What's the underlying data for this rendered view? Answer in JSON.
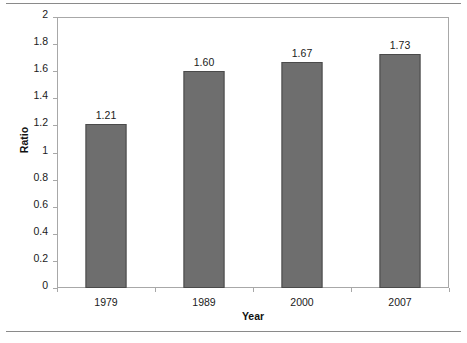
{
  "chart_data": {
    "type": "bar",
    "title": "",
    "categories": [
      "1979",
      "1989",
      "2000",
      "2007"
    ],
    "values": [
      1.21,
      1.6,
      1.67,
      1.73
    ],
    "value_labels": [
      "1.21",
      "1.60",
      "1.67",
      "1.73"
    ],
    "xlabel": "Year",
    "ylabel": "Ratio",
    "ylim": [
      0,
      2
    ],
    "ytick_step": 0.2,
    "ytick_labels": [
      "2",
      "1.8",
      "1.6",
      "1.4",
      "1.2",
      "1",
      "0.8",
      "0.6",
      "0.4",
      "0.2",
      "0"
    ],
    "ytick_values": [
      2,
      1.8,
      1.6,
      1.4,
      1.2,
      1,
      0.8,
      0.6,
      0.4,
      0.2,
      0
    ],
    "grid": false,
    "legend": null,
    "bar_color": "#6e6e6e",
    "bar_edge_color": "#4a4a4a",
    "plot_background": "#ffffff",
    "axis_color": "#a8a8a8",
    "series": [
      {
        "name": "Ratio",
        "values": [
          1.21,
          1.6,
          1.67,
          1.73
        ]
      }
    ]
  },
  "figure": {
    "background": "#ffffff",
    "rule_color": "#8a8a8a"
  }
}
